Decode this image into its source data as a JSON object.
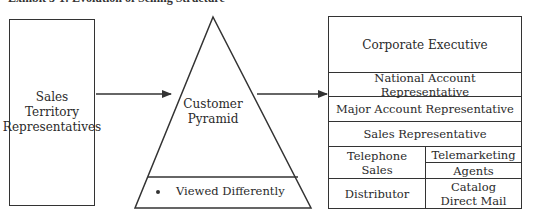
{
  "title": "Exhibit 3-1: Evolution of Selling Structure",
  "left_box": {
    "lines": [
      "Sales",
      "Territory",
      "Representatives"
    ]
  },
  "pyramid": {
    "label_lines": [
      "Customer",
      "Pyramid"
    ],
    "bullet": "Viewed Differently"
  },
  "right_box": {
    "rows": {
      "corporate": "Corporate Executive",
      "national": "National Account Representative",
      "major": "Major Account Representative",
      "sales_rep": "Sales Representative"
    },
    "telephone_sales": [
      "Telephone",
      "Sales"
    ],
    "telemarketing": "Telemarketing",
    "agents": "Agents",
    "distributor": "Distributor",
    "catalog": [
      "Catalog",
      "Direct Mail"
    ]
  },
  "colors": {
    "line": "#333333",
    "text": "#2a2a2a",
    "background": "#ffffff"
  }
}
